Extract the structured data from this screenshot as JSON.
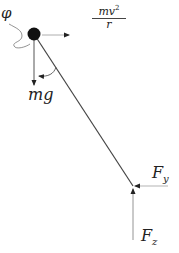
{
  "diagram": {
    "type": "free-body diagram of conical pendulum",
    "labels": {
      "angle": "φ",
      "centripetal_num": "mv",
      "centripetal_exp": "2",
      "centripetal_den": "r",
      "weight": "mg",
      "force_y_base": "F",
      "force_y_sub": "y",
      "force_z_base": "F",
      "force_z_sub": "z"
    },
    "colors": {
      "line": "#444444",
      "mass": "#111111",
      "text": "#222222"
    }
  }
}
